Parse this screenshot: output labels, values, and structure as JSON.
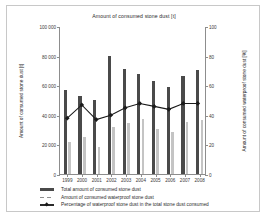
{
  "chart_data": {
    "type": "bar",
    "title": "Amount of consumed stone dust [t]",
    "xlabel": "",
    "ylabel": "Amount of consumed stone dust [t]",
    "y2label": "Amount of consumed waterproof stone dust [%]",
    "categories": [
      "1999",
      "2000",
      "2001",
      "2002",
      "2003",
      "2004",
      "2005",
      "2006",
      "2007",
      "2008"
    ],
    "ylim": [
      0,
      100000
    ],
    "y2lim": [
      0,
      100
    ],
    "yticks": [
      "0",
      "20 000",
      "40 000",
      "60 000",
      "80 000",
      "100 000"
    ],
    "ytick_values": [
      0,
      20000,
      40000,
      60000,
      80000,
      100000
    ],
    "y2ticks": [
      "0",
      "20",
      "40",
      "60",
      "80",
      "100"
    ],
    "y2tick_values": [
      0,
      20,
      40,
      60,
      80,
      100
    ],
    "grid": false,
    "legend_position": "bottom",
    "series": [
      {
        "name": "Total amount of consumed stone dust",
        "type": "bar",
        "axis": "left",
        "color": "#4a4a4a",
        "values": [
          57000,
          52500,
          50000,
          80000,
          71000,
          67500,
          63000,
          59000,
          66000,
          70000
        ]
      },
      {
        "name": "Amount of consumed waterproof stone dust",
        "type": "bar",
        "axis": "left",
        "color": "#c4c4c4",
        "values": [
          21500,
          25000,
          18500,
          32000,
          34500,
          37500,
          30500,
          28500,
          35000,
          36500
        ]
      },
      {
        "name": "Percentage of waterproof stone dust in the total stone dust consumed",
        "type": "line",
        "axis": "right",
        "color": "#1a1a1a",
        "values": [
          38,
          47,
          37,
          40,
          45,
          48,
          46,
          44,
          48,
          48
        ]
      }
    ]
  },
  "legend": {
    "items": [
      {
        "label": "Total amount of consumed stone dust",
        "key": "solid-bar-key"
      },
      {
        "label": "Amount of consumed waterproof stone dust",
        "key": "dashed-bar-key"
      },
      {
        "label": "Percentage of waterproof stone dust in the total stone dust consumed",
        "key": "line-marker-key"
      }
    ]
  }
}
